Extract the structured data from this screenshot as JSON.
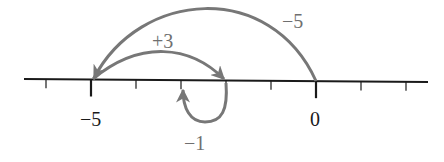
{
  "diagram": {
    "type": "number-line",
    "colors": {
      "axis": "#1a1a1a",
      "arrow": "#777777",
      "axis_label": "#1a1a1a",
      "jump_label": "#6f6f6f"
    },
    "axis": {
      "x_start": 24,
      "x_end": 428,
      "y": 80,
      "unit_px": 45,
      "zero_x": 316,
      "ticks": [
        -6,
        -5,
        -4,
        -3,
        -2,
        -1,
        0,
        1,
        2
      ],
      "major_ticks": [
        -5,
        0
      ],
      "labels": [
        {
          "value": -5,
          "text": "−5"
        },
        {
          "value": 0,
          "text": "0"
        }
      ]
    },
    "jumps": [
      {
        "from": 0,
        "to": -5,
        "label": "−5",
        "direction": "left",
        "position": "above"
      },
      {
        "from": -5,
        "to": -2,
        "label": "+3",
        "direction": "right",
        "position": "above"
      },
      {
        "from": -2,
        "to": -1,
        "label": "−1",
        "direction": "loop-below",
        "position": "below"
      }
    ]
  }
}
